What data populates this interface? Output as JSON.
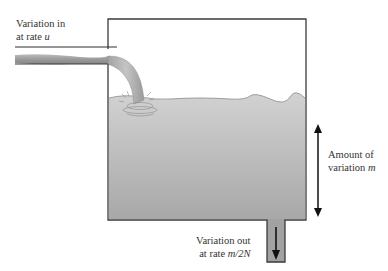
{
  "diagram": {
    "type": "tank-flow-analogy",
    "labels": {
      "inflow": {
        "line1": "Variation in",
        "line2_prefix": "at rate ",
        "line2_var": "u"
      },
      "amount": {
        "line1": "Amount of",
        "line2_prefix": "variation ",
        "line2_var": "m"
      },
      "outflow": {
        "line1": "Variation out",
        "line2_prefix": "at rate ",
        "line2_var": "m/2N"
      }
    },
    "colors": {
      "outline": "#3a3a3a",
      "water_top": "#cfcfcf",
      "water_bottom": "#a9a9a9",
      "pipe_fill": "#a0a0a0",
      "arrow": "#111111",
      "text": "#333333"
    },
    "components": [
      "inlet-pipe",
      "water-stream",
      "splash",
      "tank",
      "water-body",
      "outlet-pipe",
      "outflow-arrow",
      "amount-double-arrow"
    ]
  }
}
